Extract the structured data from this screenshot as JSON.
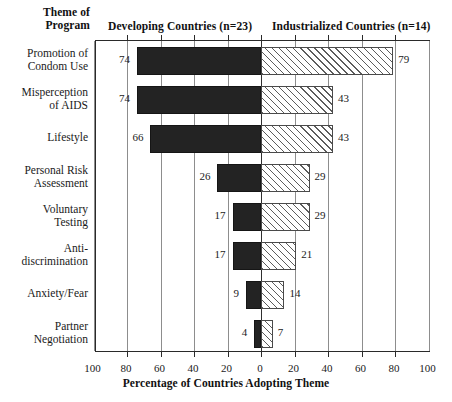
{
  "header": {
    "theme_label_line1": "Theme of",
    "theme_label_line2": "Program",
    "left_group": "Developing Countries (n=23)",
    "right_group": "Industrialized Countries (n=14)"
  },
  "axis": {
    "title": "Percentage of Countries Adopting Theme",
    "tick_labels": [
      "100",
      "80",
      "60",
      "40",
      "20",
      "0",
      "20",
      "40",
      "60",
      "80",
      "100"
    ],
    "tick_values": [
      -100,
      -80,
      -60,
      -40,
      -20,
      0,
      20,
      40,
      60,
      80,
      100
    ]
  },
  "chart_data": {
    "type": "bar",
    "title": "",
    "xlabel": "Percentage of Countries Adopting Theme",
    "ylabel": "Theme of Program",
    "orientation": "horizontal",
    "layout": "diverging-bidirectional",
    "xlim": [
      -100,
      100
    ],
    "grid": true,
    "legend_position": "top",
    "categories": [
      "Promotion of Condom Use",
      "Misperception of AIDS",
      "Lifestyle",
      "Personal Risk Assessment",
      "Voluntary Testing",
      "Anti-discrimination",
      "Anxiety/Fear",
      "Partner Negotiation"
    ],
    "category_lines": [
      [
        "Promotion of",
        "Condom Use"
      ],
      [
        "Misperception",
        "of AIDS"
      ],
      [
        "Lifestyle"
      ],
      [
        "Personal Risk",
        "Assessment"
      ],
      [
        "Voluntary",
        "Testing"
      ],
      [
        "Anti-",
        "discrimination"
      ],
      [
        "Anxiety/Fear"
      ],
      [
        "Partner",
        "Negotiation"
      ]
    ],
    "series": [
      {
        "name": "Developing Countries (n=23)",
        "direction": "left",
        "fill": "solid-black",
        "values": [
          74,
          74,
          66,
          26,
          17,
          17,
          9,
          4
        ]
      },
      {
        "name": "Industrialized Countries (n=14)",
        "direction": "right",
        "fill": "diagonal-hatch",
        "values": [
          79,
          43,
          43,
          29,
          29,
          21,
          14,
          7
        ]
      }
    ]
  },
  "colors": {
    "left_bar": "#232323",
    "right_bar_line": "#5c5c5c",
    "frame": "#2a2a2a",
    "gridline": "#8d8d8d",
    "text": "#1a1a1a"
  }
}
